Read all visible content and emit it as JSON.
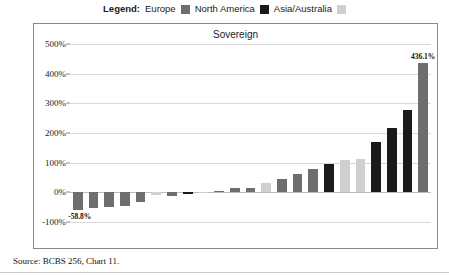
{
  "legend": {
    "title": "Legend:",
    "items": [
      {
        "label": "Europe",
        "color": "#6e6e6e",
        "name": "europe"
      },
      {
        "label": "North America",
        "color": "#1a1a1a",
        "name": "north-america"
      },
      {
        "label": "Asia/Australia",
        "color": "#cfcfcf",
        "name": "asia-australia"
      }
    ]
  },
  "source": {
    "text": "Source: BCBS 256, Chart 11."
  },
  "chart_data": {
    "type": "bar",
    "title": "Sovereign",
    "xlabel": "",
    "ylabel": "",
    "ylim": [
      -100,
      500
    ],
    "yticks": [
      500,
      400,
      300,
      200,
      100,
      0,
      -100
    ],
    "ytick_labels": [
      "500%",
      "400%",
      "300%",
      "200%",
      "100%",
      "0%",
      "-100%"
    ],
    "grid": true,
    "legend_position": "top-center",
    "annotations": [
      {
        "text": "436.1%",
        "value": 436.1,
        "bar_index": 22
      },
      {
        "text": "-58.8%",
        "value": -58.8,
        "bar_index": 0
      }
    ],
    "series": [
      {
        "name": "Europe",
        "color": "#6e6e6e"
      },
      {
        "name": "North America",
        "color": "#1a1a1a"
      },
      {
        "name": "Asia/Australia",
        "color": "#cfcfcf"
      }
    ],
    "values": [
      -58.8,
      -52.0,
      -48.0,
      -45.0,
      -34.0,
      -10.0,
      -13.0,
      -6.0,
      -1.0,
      6.0,
      16.0,
      13.0,
      30.0,
      46.0,
      62.0,
      80.0,
      95.0,
      108.0,
      112.0,
      168.0,
      218.0,
      277.0,
      436.1
    ],
    "colors": [
      "#6e6e6e",
      "#6e6e6e",
      "#6e6e6e",
      "#6e6e6e",
      "#6e6e6e",
      "#cfcfcf",
      "#6e6e6e",
      "#1a1a1a",
      "#cfcfcf",
      "#6e6e6e",
      "#6e6e6e",
      "#6e6e6e",
      "#cfcfcf",
      "#6e6e6e",
      "#6e6e6e",
      "#6e6e6e",
      "#1a1a1a",
      "#cfcfcf",
      "#cfcfcf",
      "#1a1a1a",
      "#1a1a1a",
      "#1a1a1a",
      "#6e6e6e"
    ],
    "regions": [
      "Europe",
      "Europe",
      "Europe",
      "Europe",
      "Europe",
      "Asia/Australia",
      "Europe",
      "North America",
      "Asia/Australia",
      "Europe",
      "Europe",
      "Europe",
      "Asia/Australia",
      "Europe",
      "Europe",
      "Europe",
      "North America",
      "Asia/Australia",
      "Asia/Australia",
      "North America",
      "North America",
      "North America",
      "Europe"
    ]
  }
}
